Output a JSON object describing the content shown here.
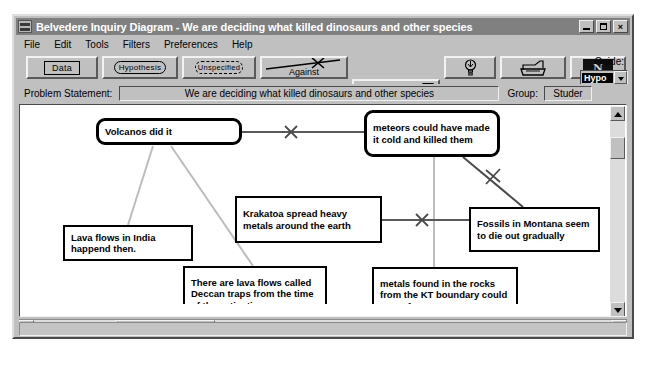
{
  "window": {
    "title": "Belvedere Inquiry Diagram - We are deciding what killed dinosaurs and other species",
    "icon": "app-icon",
    "minimize_label": "",
    "maximize_label": "",
    "close_label": "×"
  },
  "menu": {
    "items": [
      {
        "label": "File"
      },
      {
        "label": "Edit"
      },
      {
        "label": "Tools"
      },
      {
        "label": "Filters"
      },
      {
        "label": "Preferences"
      },
      {
        "label": "Help"
      }
    ]
  },
  "toolbar": {
    "data_label": "Data",
    "hypothesis_label": "Hypothesis",
    "unspecified_label": "Unspecified",
    "against_label": "Against",
    "for_label": "For",
    "hint_icon": "lightbulb-icon",
    "print_icon": "printer-icon",
    "note_icon": "n-icon",
    "note_letter": "N"
  },
  "guide": {
    "label": "Guide:",
    "selected": "Hypo"
  },
  "problem": {
    "label": "Problem Statement:",
    "statement": "We are deciding what killed dinosaurs and other species",
    "group_label": "Group:",
    "group_value": "Studer"
  },
  "diagram": {
    "nodes": [
      {
        "id": "volcanos",
        "type": "hypothesis",
        "text": "Volcanos did it",
        "x": 76,
        "y": 13,
        "w": 146,
        "h": 27
      },
      {
        "id": "meteors",
        "type": "hypothesis",
        "text": "meteors could have made it cold and killed them",
        "x": 344,
        "y": 5,
        "w": 136,
        "h": 47
      },
      {
        "id": "krakatoa",
        "type": "data",
        "text": "Krakatoa spread heavy metals around the earth",
        "x": 215,
        "y": 91,
        "w": 147,
        "h": 47
      },
      {
        "id": "fossils",
        "type": "data",
        "text": "Fossils in Montana seem to die out gradually",
        "x": 449,
        "y": 102,
        "w": 131,
        "h": 45
      },
      {
        "id": "lava-india",
        "type": "data",
        "text": "Lava flows in India happend then.",
        "x": 43,
        "y": 120,
        "w": 130,
        "h": 36
      },
      {
        "id": "deccan-traps",
        "type": "data",
        "text": "There are lava flows called Deccan traps from the time of the extinctions",
        "x": 163,
        "y": 161,
        "w": 144,
        "h": 56
      },
      {
        "id": "kt-metals",
        "type": "data",
        "text": "metals found in the rocks from the KT boundary could come from meteors",
        "x": 352,
        "y": 162,
        "w": 146,
        "h": 56
      }
    ],
    "links": [
      {
        "id": "volcanos-against-meteors",
        "type": "against",
        "from": "volcanos",
        "to": "meteors"
      },
      {
        "id": "krakatoa-against-fossils",
        "type": "against",
        "from": "krakatoa",
        "to": "fossils"
      },
      {
        "id": "meteors-against-fossils",
        "type": "against",
        "from": "meteors",
        "to": "fossils"
      },
      {
        "id": "lava-india-for-volcanos",
        "type": "for",
        "from": "lava-india",
        "to": "volcanos"
      },
      {
        "id": "deccan-for-volcanos",
        "type": "for",
        "from": "deccan-traps",
        "to": "volcanos"
      },
      {
        "id": "kt-metals-for-meteors",
        "type": "for",
        "from": "kt-metals",
        "to": "meteors"
      }
    ],
    "colors": {
      "node_border": "#000000",
      "against_link": "#555555",
      "for_link": "#b4b4b4",
      "canvas_bg": "#ffffff"
    }
  },
  "scrollbars": {
    "vertical_up": "scroll-up",
    "vertical_down": "scroll-down",
    "horizontal_left": "scroll-left",
    "horizontal_right": "scroll-right"
  }
}
